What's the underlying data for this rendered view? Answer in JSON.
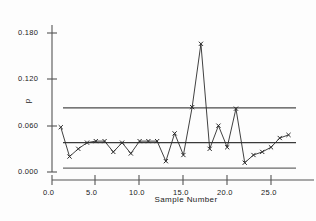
{
  "chart_data": {
    "type": "line",
    "title": "",
    "subtitle": "",
    "xlabel": "Sample  Number",
    "ylabel": "p",
    "xlim": [
      0.0,
      29.0
    ],
    "ylim": [
      0.0,
      0.195
    ],
    "xticks": [
      0.0,
      5.0,
      10.0,
      15.0,
      20.0,
      25.0
    ],
    "xticklabels": [
      "0.0",
      "5.0",
      "10.0",
      "15.0",
      "20.0",
      "25.0"
    ],
    "yticks": [
      0.0,
      0.06,
      0.12,
      0.18
    ],
    "yticklabels": [
      "0.000",
      "0.060",
      "0.120",
      "0.180"
    ],
    "grid": false,
    "legend": null,
    "marker": "x",
    "series": [
      {
        "name": "p",
        "x": [
          1,
          2,
          3,
          4,
          5,
          6,
          7,
          8,
          9,
          10,
          11,
          12,
          13,
          14,
          15,
          16,
          17,
          18,
          19,
          20,
          21,
          22,
          23,
          24,
          25,
          26,
          27
        ],
        "values": [
          0.058,
          0.02,
          0.03,
          0.038,
          0.04,
          0.04,
          0.026,
          0.038,
          0.024,
          0.04,
          0.04,
          0.04,
          0.014,
          0.05,
          0.022,
          0.084,
          0.166,
          0.03,
          0.06,
          0.032,
          0.082,
          0.012,
          0.022,
          0.026,
          0.032,
          0.044,
          0.048
        ]
      }
    ],
    "control_lines": [
      {
        "name": "upper-control-limit",
        "value": 0.083,
        "color": "#4a4a4a"
      },
      {
        "name": "center-line",
        "value": 0.038,
        "color": "#3a3a3a"
      },
      {
        "name": "lower-control-limit",
        "value": 0.005,
        "color": "#6a6a6a"
      }
    ],
    "axis_color": "#555555",
    "line_color": "#2b2b2b"
  }
}
